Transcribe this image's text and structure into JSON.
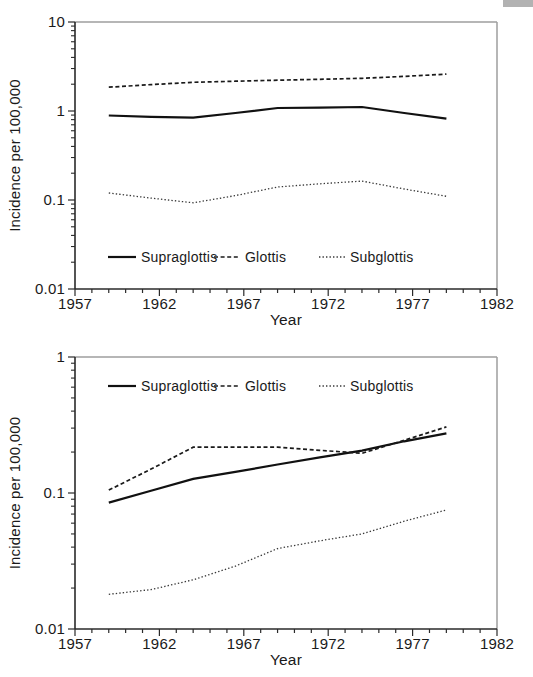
{
  "figure": {
    "colors": {
      "line": "#1a1a1a",
      "frame_gray": "#9e9e9e",
      "axis": "#2a2a2a",
      "text": "#1a1a1a",
      "scan_artifact": "#b2b2b2"
    }
  },
  "chart_data": [
    {
      "type": "line",
      "title": "",
      "xlabel": "Year",
      "ylabel": "Incidence per 100,000",
      "yscale": "log",
      "xlim": [
        1957,
        1982
      ],
      "ylim": [
        0.01,
        10
      ],
      "x_major_ticks": [
        1957,
        1962,
        1967,
        1972,
        1977,
        1982
      ],
      "x_minor_step": 1,
      "y_tick_labels": [
        "10",
        "1",
        "0.1",
        "0.01"
      ],
      "grid": false,
      "legend_position": "inside-bottom",
      "x": [
        1959,
        1961.5,
        1964,
        1966.5,
        1969,
        1971.5,
        1974,
        1976.5,
        1979
      ],
      "series": [
        {
          "name": "Supraglottis",
          "style": "solid",
          "values": [
            0.89,
            0.86,
            0.84,
            0.95,
            1.08,
            1.09,
            1.11,
            0.95,
            0.82
          ]
        },
        {
          "name": "Glottis",
          "style": "dashed",
          "values": [
            1.85,
            1.98,
            2.1,
            2.16,
            2.22,
            2.27,
            2.33,
            2.45,
            2.6
          ]
        },
        {
          "name": "Subglottis",
          "style": "dotted",
          "values": [
            0.12,
            0.105,
            0.093,
            0.112,
            0.14,
            0.152,
            0.163,
            0.133,
            0.11
          ]
        }
      ]
    },
    {
      "type": "line",
      "title": "",
      "xlabel": "Year",
      "ylabel": "Incidence per 100,000",
      "yscale": "log",
      "xlim": [
        1957,
        1982
      ],
      "ylim": [
        0.01,
        1
      ],
      "x_major_ticks": [
        1957,
        1962,
        1967,
        1972,
        1977,
        1982
      ],
      "x_minor_step": 1,
      "y_tick_labels": [
        "1",
        "0.1",
        "0.01"
      ],
      "grid": false,
      "legend_position": "inside-top",
      "x": [
        1959,
        1961.5,
        1964,
        1966.5,
        1969,
        1971.5,
        1974,
        1976.5,
        1979
      ],
      "series": [
        {
          "name": "Supraglottis",
          "style": "solid",
          "values": [
            0.085,
            0.104,
            0.127,
            0.143,
            0.162,
            0.183,
            0.205,
            0.24,
            0.275
          ]
        },
        {
          "name": "Glottis",
          "style": "dashed",
          "values": [
            0.105,
            0.15,
            0.217,
            0.217,
            0.217,
            0.206,
            0.196,
            0.244,
            0.306
          ]
        },
        {
          "name": "Subglottis",
          "style": "dotted",
          "values": [
            0.018,
            0.0195,
            0.023,
            0.029,
            0.039,
            0.0445,
            0.05,
            0.062,
            0.075
          ]
        }
      ]
    }
  ]
}
